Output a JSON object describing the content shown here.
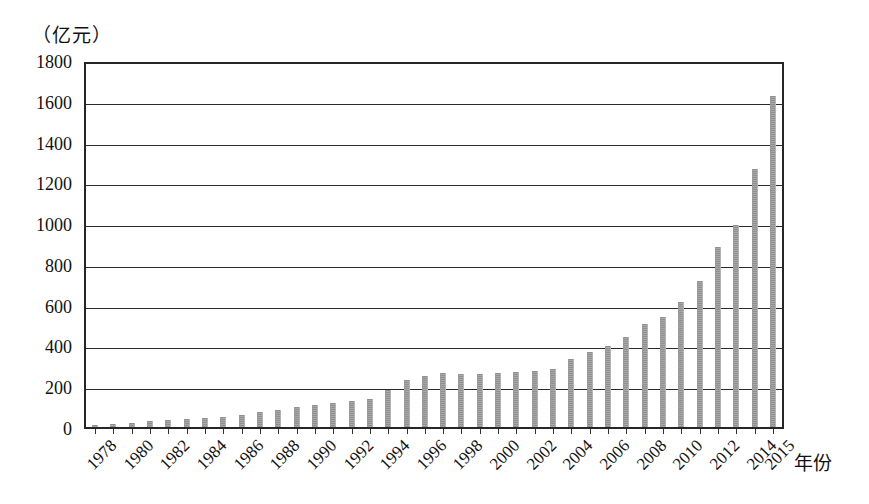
{
  "chart_data": {
    "type": "bar",
    "title": "",
    "subtitle": "",
    "xlabel": "年份",
    "ylabel": "（亿元）",
    "ylim": [
      0,
      1800
    ],
    "ytick_step": 200,
    "yticks": [
      "1800",
      "1600",
      "1400",
      "1200",
      "1000",
      "800",
      "600",
      "400",
      "200",
      "0"
    ],
    "grid": true,
    "legend": "none",
    "bar_color": "#9a9a9a",
    "axis_color": "#262626",
    "categories": [
      "1978",
      "1979",
      "1980",
      "1981",
      "1982",
      "1983",
      "1984",
      "1985",
      "1986",
      "1987",
      "1988",
      "1989",
      "1990",
      "1991",
      "1992",
      "1993",
      "1994",
      "1995",
      "1996",
      "1997",
      "1998",
      "1999",
      "2000",
      "2001",
      "2002",
      "2003",
      "2004",
      "2005",
      "2006",
      "2007",
      "2008",
      "2009",
      "2010",
      "2011",
      "2012",
      "2013",
      "2014",
      "2015"
    ],
    "values": [
      12,
      16,
      22,
      28,
      34,
      38,
      45,
      52,
      60,
      72,
      85,
      100,
      110,
      118,
      128,
      140,
      185,
      232,
      255,
      268,
      262,
      265,
      270,
      272,
      276,
      290,
      338,
      370,
      400,
      445,
      510,
      545,
      622,
      725,
      895,
      1000,
      1278,
      1640
    ],
    "visible_tick_labels": [
      "1978",
      "1980",
      "1982",
      "1984",
      "1986",
      "1988",
      "1990",
      "1992",
      "1994",
      "1996",
      "1998",
      "2000",
      "2002",
      "2004",
      "2006",
      "2008",
      "2010",
      "2012",
      "2014",
      "2015"
    ]
  }
}
